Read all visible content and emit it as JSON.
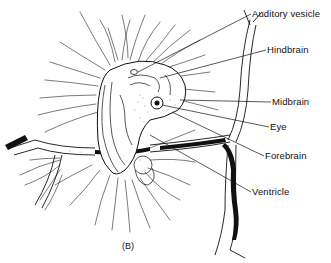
{
  "figure": {
    "panel_label": "(B)",
    "labels": [
      {
        "id": "auditory-vesicle",
        "text": "Auditory vesicle",
        "x": 252,
        "y": 8
      },
      {
        "id": "hindbrain",
        "text": "Hindbrain",
        "x": 267,
        "y": 44
      },
      {
        "id": "midbrain",
        "text": "Midbrain",
        "x": 272,
        "y": 96
      },
      {
        "id": "eye",
        "text": "Eye",
        "x": 270,
        "y": 121
      },
      {
        "id": "forebrain",
        "text": "Forebrain",
        "x": 265,
        "y": 150
      },
      {
        "id": "ventricle",
        "text": "Ventricle",
        "x": 252,
        "y": 186
      }
    ],
    "colors": {
      "ink": "#111111",
      "background": "#ffffff"
    }
  }
}
